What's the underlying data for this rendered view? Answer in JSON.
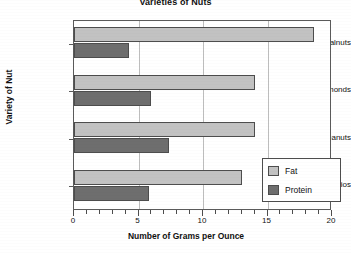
{
  "chart_data": {
    "type": "bar",
    "orientation": "horizontal",
    "title": "Varieties of Nuts",
    "xlabel": "Number of Grams per Ounce",
    "ylabel": "Variety of Nut",
    "categories": [
      "Walnuts",
      "Almonds",
      "Peanuts",
      "Pistachios"
    ],
    "series": [
      {
        "name": "Fat",
        "color": "#c2c2c2",
        "values": [
          18.6,
          14.0,
          14.0,
          13.0
        ]
      },
      {
        "name": "Protein",
        "color": "#6e6e6e",
        "values": [
          4.3,
          6.0,
          7.4,
          5.8
        ]
      }
    ],
    "xlim": [
      0,
      20
    ],
    "xticks": [
      0,
      5,
      10,
      15,
      20
    ],
    "xtick_labels": [
      "0",
      "5",
      "10",
      "15",
      "20"
    ],
    "xminor_tick_step": 1,
    "grid": "vertical",
    "legend_position": "lower-right",
    "legend_entries": [
      "Fat",
      "Protein"
    ]
  },
  "colors": {
    "fat": "#c2c2c2",
    "protein": "#6e6e6e",
    "axis": "#4d4d4d",
    "grid": "#bdbdbd",
    "background": "#ffffff",
    "text": "#111111"
  }
}
